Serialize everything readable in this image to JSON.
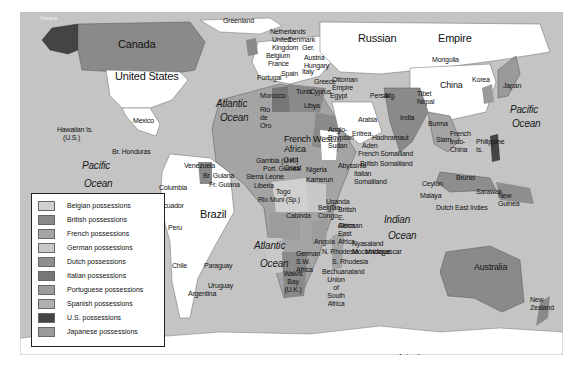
{
  "map": {
    "title": "Colonial possessions world map",
    "colors": {
      "ocean": "#c4c4c4",
      "independent": "#ffffff",
      "belgian": "#d0d0d0",
      "british": "#8a8a8a",
      "french": "#a4a4a4",
      "german": "#c8c8c8",
      "dutch": "#8e8e8e",
      "italian": "#767676",
      "portuguese": "#9c9c9c",
      "spanish": "#b0b0b0",
      "us": "#444444",
      "japanese": "#9a9a9a"
    },
    "regions": {
      "alaska": "Alaska",
      "canada": "Canada",
      "united_states": "United States",
      "greenland": "Greenland",
      "mexico": "Mexico",
      "hawaii": "Hawaiian Is.",
      "hawaii_sub": "(U.S.)",
      "br_honduras": "Br. Honduras",
      "venezuela": "Venezuela",
      "br_guiana": "Br. Guiana",
      "fr_guiana": "Fr. Guiana",
      "columbia": "Columbia",
      "ecuador": "Ecuador",
      "peru": "Peru",
      "brazil": "Brazil",
      "chile": "Chile",
      "paraguay": "Paraguay",
      "uruguay": "Uruguay",
      "argentina": "Argentina",
      "netherlands": "Netherlands",
      "united_kingdom": "United Kingdom",
      "belgium": "Belgium",
      "france": "France",
      "portugal": "Portugal",
      "spain": "Spain",
      "denmark": "Denmark",
      "germany": "Ger.",
      "austria_hungary": "Austria Hungary",
      "italy": "Italy",
      "greece": "Greece",
      "ottoman_empire": "Ottoman Empire",
      "tunis": "Tunis",
      "cyprus": "Cyprus",
      "morocco": "Morocco",
      "rio_de_oro": "Rio de Oro",
      "libya": "Libya",
      "egypt": "Egypt",
      "russian_empire_1": "Russian",
      "russian_empire_2": "Empire",
      "persia": "Persia",
      "afg": "Afg.",
      "arabia": "Arabia",
      "mongolia": "Mongolia",
      "china": "China",
      "korea": "Korea",
      "japan": "Japan",
      "tibet": "Tibet",
      "nepal": "Nepal",
      "india": "India",
      "burma": "Burma",
      "siam": "Siam",
      "french_indo_china": "French Indo-China",
      "philippine": "Philippine Is.",
      "ceylon": "Ceylon",
      "malaya": "Malaya",
      "brunei": "Brunei",
      "sarawak": "Sarawak",
      "dutch_east_indies": "Dutch East Indies",
      "new_guinea": "New Guinea",
      "australia": "Australia",
      "new_zealand": "New Zealand",
      "french_west_africa": "French West Africa",
      "anglo_egyptian_sudan": "Anglo-Egyptian Sudan",
      "eritrea": "Eritrea",
      "hadhramaut": "Hadhramaut",
      "aden": "Aden",
      "french_somaliland": "French Somaliland",
      "british_somaliland": "British Somaliland",
      "abyssinia": "Abyssinia",
      "italian_somaliland": "Italian Somaliland",
      "gambia": "Gambia (U.K.)",
      "port_guinea": "Port. Guinea",
      "sierra_leone": "Sierra Leone",
      "liberia": "Liberia",
      "gold_coast": "Gold Coast",
      "togo": "Togo",
      "nigeria": "Nigeria",
      "kamerun": "Kamerun",
      "rio_muni": "Rio Muni (Sp.)",
      "french_eq": "French",
      "uganda": "Uganda",
      "british_east_africa": "British E. Africa",
      "cabinda": "Cabinda",
      "belgian_congo": "Belgian Congo",
      "german_east_africa": "German East Africa",
      "nyasaland": "Nyasaland",
      "mocambique": "Mocambique",
      "angola": "Angola",
      "n_rhodesia": "N. Rhodesia",
      "s_rhodesia": "S. Rhodesia",
      "madagascar": "Madagascar",
      "german_sw_africa": "German S.W. Africa",
      "walvis_bay": "Walvis Bay (U.K.)",
      "bechuanaland": "Bechuanaland",
      "union_south_africa": "Union of South Africa",
      "antarctica": "Antarctica"
    },
    "oceans": {
      "atlantic_n_1": "Atlantic",
      "atlantic_n_2": "Ocean",
      "pacific_e_1": "Pacific",
      "pacific_e_2": "Ocean",
      "pacific_w_1": "Pacific",
      "pacific_w_2": "Ocean",
      "atlantic_s_1": "Atlantic",
      "atlantic_s_2": "Ocean",
      "indian_1": "Indian",
      "indian_2": "Ocean"
    }
  },
  "legend": {
    "items": [
      {
        "label": "Belgian possessions",
        "color": "#d0d0d0"
      },
      {
        "label": "British possessions",
        "color": "#8a8a8a"
      },
      {
        "label": "French possessions",
        "color": "#a4a4a4"
      },
      {
        "label": "German possessions",
        "color": "#c8c8c8"
      },
      {
        "label": "Dutch possessions",
        "color": "#8e8e8e"
      },
      {
        "label": "Italian possessions",
        "color": "#767676"
      },
      {
        "label": "Portuguese possessions",
        "color": "#9c9c9c"
      },
      {
        "label": "Spanish possessions",
        "color": "#b0b0b0"
      },
      {
        "label": "U.S. possessions",
        "color": "#444444"
      },
      {
        "label": "Japanese possessions",
        "color": "#9a9a9a"
      }
    ]
  }
}
